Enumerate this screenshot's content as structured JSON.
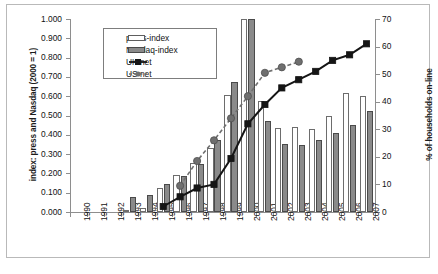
{
  "chart_data": {
    "type": "bar",
    "title": "",
    "xlabel": "",
    "ylabel": "index: press and Nasdaq (2000 = 1)",
    "y2label": "% of households on-line",
    "categories": [
      "1990",
      "1991",
      "1992",
      "1993",
      "1994",
      "1995",
      "1996",
      "1997",
      "1998",
      "1999",
      "2000",
      "2001",
      "2002",
      "2003",
      "2004",
      "2005",
      "2006",
      "2007"
    ],
    "ylim": [
      0,
      1.0
    ],
    "yticks": [
      "0.000",
      "0.100",
      "0.200",
      "0.300",
      "0.400",
      "0.500",
      "0.600",
      "0.700",
      "0.800",
      "0.900",
      "1.000"
    ],
    "ytick_values": [
      0,
      0.1,
      0.2,
      0.3,
      0.4,
      0.5,
      0.6,
      0.7,
      0.8,
      0.9,
      1.0
    ],
    "y2lim": [
      0,
      70
    ],
    "y2ticks": [
      "0",
      "10",
      "20",
      "30",
      "40",
      "50",
      "60",
      "70"
    ],
    "y2tick_values": [
      0,
      10,
      20,
      30,
      40,
      50,
      60,
      70
    ],
    "grid": false,
    "legend_position": "upper-left-inside",
    "series": [
      {
        "name": "press-index",
        "type": "bar",
        "axis": "left",
        "color": "#ffffff",
        "edge": "#6d6d6d",
        "values": [
          0,
          0,
          0,
          0.01,
          0.022,
          0.125,
          0.193,
          0.253,
          0.33,
          0.604,
          1.0,
          0.575,
          0.433,
          0.438,
          0.428,
          0.497,
          0.617,
          0.603
        ]
      },
      {
        "name": "Nasdaq-index",
        "type": "bar",
        "axis": "left",
        "color": "#8a8a8a",
        "edge": "#4a4a4a",
        "values": [
          0,
          0,
          0,
          0.079,
          0.088,
          0.145,
          0.186,
          0.249,
          0.371,
          0.673,
          1.0,
          0.474,
          0.35,
          0.347,
          0.372,
          0.408,
          0.449,
          0.523
        ]
      },
      {
        "name": "UK net",
        "type": "line",
        "axis": "right",
        "color": "#151515",
        "marker": "square",
        "dash": "solid",
        "values": [
          null,
          null,
          null,
          null,
          null,
          2.0,
          5.5,
          8.7,
          10.0,
          19.4,
          32.0,
          39.0,
          45.0,
          48.0,
          51.0,
          55.0,
          57.0,
          61.0
        ]
      },
      {
        "name": "US net",
        "type": "line",
        "axis": "right",
        "color": "#6f6f6f",
        "marker": "circle",
        "dash": "dashed",
        "values": [
          null,
          null,
          null,
          null,
          null,
          null,
          9.5,
          18.5,
          26.0,
          34.0,
          42.0,
          50.5,
          52.5,
          54.5,
          null,
          null,
          null,
          null
        ]
      }
    ]
  },
  "legend": {
    "items": [
      {
        "label": "press-index",
        "key": "bar-white"
      },
      {
        "label": "Nasdaq-index",
        "key": "bar-gray"
      },
      {
        "label": "UK net",
        "key": "line-square-solid"
      },
      {
        "label": "US net",
        "key": "line-circle-dashed"
      }
    ]
  }
}
